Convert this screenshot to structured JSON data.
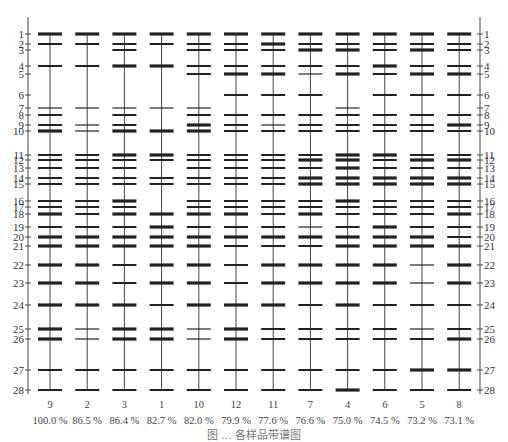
{
  "chart_data": {
    "type": "gel_band_diagram",
    "title": "",
    "axis_label_left": "",
    "band_positions": {
      "1": 34,
      "2": 44,
      "3": 50,
      "4": 66,
      "5": 74,
      "6": 95,
      "7": 108,
      "8": 115,
      "9": 125,
      "10": 131,
      "11": 155,
      "12": 160,
      "13": 168,
      "14": 178,
      "15": 184,
      "16": 201,
      "17": 207,
      "18": 214,
      "19": 227,
      "20": 237,
      "21": 246,
      "22": 265,
      "23": 283,
      "24": 305,
      "25": 329,
      "26": 339,
      "27": 370,
      "28": 390
    },
    "band_numbers": [
      1,
      2,
      3,
      4,
      5,
      6,
      7,
      8,
      9,
      10,
      11,
      12,
      13,
      14,
      15,
      16,
      17,
      18,
      19,
      20,
      21,
      22,
      23,
      24,
      25,
      26,
      27,
      28
    ],
    "band_weight_legend": {
      "1": "thin",
      "2": "medium",
      "3": "thick"
    },
    "lanes": [
      {
        "sample": "9",
        "similarity": "100.0 %",
        "bands": [
          [
            1,
            3
          ],
          [
            2,
            2
          ],
          [
            4,
            2
          ],
          [
            7,
            1
          ],
          [
            8,
            2
          ],
          [
            9,
            2
          ],
          [
            10,
            3
          ],
          [
            11,
            2
          ],
          [
            12,
            2
          ],
          [
            13,
            2
          ],
          [
            14,
            2
          ],
          [
            15,
            2
          ],
          [
            16,
            2
          ],
          [
            17,
            2
          ],
          [
            18,
            3
          ],
          [
            19,
            2
          ],
          [
            20,
            3
          ],
          [
            21,
            3
          ],
          [
            22,
            3
          ],
          [
            23,
            3
          ],
          [
            24,
            3
          ],
          [
            25,
            3
          ],
          [
            26,
            3
          ],
          [
            27,
            2
          ],
          [
            28,
            2
          ]
        ]
      },
      {
        "sample": "2",
        "similarity": "86.5 %",
        "bands": [
          [
            1,
            3
          ],
          [
            2,
            2
          ],
          [
            4,
            2
          ],
          [
            7,
            1
          ],
          [
            9,
            1
          ],
          [
            10,
            1
          ],
          [
            11,
            2
          ],
          [
            12,
            2
          ],
          [
            13,
            2
          ],
          [
            14,
            2
          ],
          [
            15,
            2
          ],
          [
            16,
            2
          ],
          [
            17,
            2
          ],
          [
            18,
            2
          ],
          [
            19,
            2
          ],
          [
            20,
            3
          ],
          [
            21,
            3
          ],
          [
            22,
            3
          ],
          [
            23,
            3
          ],
          [
            24,
            3
          ],
          [
            25,
            1
          ],
          [
            26,
            1
          ],
          [
            27,
            2
          ],
          [
            28,
            2
          ]
        ]
      },
      {
        "sample": "3",
        "similarity": "86.4 %",
        "bands": [
          [
            1,
            3
          ],
          [
            2,
            2
          ],
          [
            3,
            2
          ],
          [
            4,
            3
          ],
          [
            7,
            1
          ],
          [
            8,
            2
          ],
          [
            9,
            2
          ],
          [
            10,
            3
          ],
          [
            11,
            3
          ],
          [
            12,
            2
          ],
          [
            13,
            2
          ],
          [
            14,
            2
          ],
          [
            15,
            2
          ],
          [
            16,
            3
          ],
          [
            17,
            2
          ],
          [
            18,
            3
          ],
          [
            19,
            2
          ],
          [
            20,
            3
          ],
          [
            21,
            3
          ],
          [
            22,
            2
          ],
          [
            23,
            2
          ],
          [
            24,
            3
          ],
          [
            25,
            3
          ],
          [
            26,
            3
          ],
          [
            27,
            2
          ],
          [
            28,
            2
          ]
        ]
      },
      {
        "sample": "1",
        "similarity": "82.7 %",
        "bands": [
          [
            1,
            3
          ],
          [
            2,
            2
          ],
          [
            4,
            3
          ],
          [
            7,
            1
          ],
          [
            10,
            3
          ],
          [
            11,
            3
          ],
          [
            12,
            2
          ],
          [
            14,
            2
          ],
          [
            15,
            2
          ],
          [
            18,
            3
          ],
          [
            19,
            3
          ],
          [
            20,
            3
          ],
          [
            21,
            3
          ],
          [
            22,
            3
          ],
          [
            23,
            3
          ],
          [
            24,
            2
          ],
          [
            25,
            3
          ],
          [
            26,
            3
          ],
          [
            27,
            2
          ],
          [
            28,
            2
          ]
        ]
      },
      {
        "sample": "10",
        "similarity": "82.0 %",
        "bands": [
          [
            1,
            3
          ],
          [
            2,
            2
          ],
          [
            3,
            2
          ],
          [
            4,
            2
          ],
          [
            5,
            2
          ],
          [
            7,
            1
          ],
          [
            8,
            2
          ],
          [
            9,
            3
          ],
          [
            10,
            3
          ],
          [
            11,
            2
          ],
          [
            12,
            2
          ],
          [
            13,
            2
          ],
          [
            14,
            2
          ],
          [
            15,
            2
          ],
          [
            16,
            2
          ],
          [
            17,
            2
          ],
          [
            18,
            3
          ],
          [
            19,
            2
          ],
          [
            20,
            3
          ],
          [
            21,
            3
          ],
          [
            22,
            3
          ],
          [
            23,
            3
          ],
          [
            24,
            3
          ],
          [
            25,
            1
          ],
          [
            26,
            1
          ],
          [
            27,
            2
          ],
          [
            28,
            2
          ]
        ]
      },
      {
        "sample": "12",
        "similarity": "79.9 %",
        "bands": [
          [
            1,
            3
          ],
          [
            2,
            2
          ],
          [
            3,
            2
          ],
          [
            4,
            2
          ],
          [
            5,
            3
          ],
          [
            6,
            2
          ],
          [
            8,
            2
          ],
          [
            9,
            2
          ],
          [
            10,
            2
          ],
          [
            11,
            2
          ],
          [
            12,
            2
          ],
          [
            13,
            2
          ],
          [
            14,
            2
          ],
          [
            15,
            2
          ],
          [
            16,
            2
          ],
          [
            17,
            2
          ],
          [
            18,
            3
          ],
          [
            19,
            2
          ],
          [
            20,
            3
          ],
          [
            21,
            2
          ],
          [
            22,
            2
          ],
          [
            23,
            2
          ],
          [
            24,
            3
          ],
          [
            25,
            3
          ],
          [
            26,
            3
          ],
          [
            27,
            2
          ],
          [
            28,
            2
          ]
        ]
      },
      {
        "sample": "11",
        "similarity": "77.6 %",
        "bands": [
          [
            1,
            3
          ],
          [
            2,
            3
          ],
          [
            3,
            2
          ],
          [
            4,
            2
          ],
          [
            5,
            3
          ],
          [
            6,
            2
          ],
          [
            8,
            2
          ],
          [
            9,
            1
          ],
          [
            10,
            2
          ],
          [
            11,
            2
          ],
          [
            12,
            2
          ],
          [
            13,
            2
          ],
          [
            14,
            2
          ],
          [
            15,
            2
          ],
          [
            16,
            2
          ],
          [
            17,
            2
          ],
          [
            18,
            2
          ],
          [
            19,
            2
          ],
          [
            20,
            3
          ],
          [
            21,
            2
          ],
          [
            22,
            3
          ],
          [
            23,
            3
          ],
          [
            24,
            3
          ],
          [
            25,
            2
          ],
          [
            26,
            2
          ],
          [
            27,
            2
          ],
          [
            28,
            2
          ]
        ]
      },
      {
        "sample": "7",
        "similarity": "76.6 %",
        "bands": [
          [
            1,
            3
          ],
          [
            2,
            2
          ],
          [
            3,
            3
          ],
          [
            4,
            2
          ],
          [
            5,
            1
          ],
          [
            6,
            2
          ],
          [
            8,
            2
          ],
          [
            9,
            2
          ],
          [
            10,
            2
          ],
          [
            11,
            2
          ],
          [
            12,
            3
          ],
          [
            13,
            2
          ],
          [
            14,
            3
          ],
          [
            15,
            3
          ],
          [
            16,
            2
          ],
          [
            17,
            2
          ],
          [
            18,
            3
          ],
          [
            19,
            1
          ],
          [
            20,
            3
          ],
          [
            21,
            2
          ],
          [
            22,
            3
          ],
          [
            23,
            3
          ],
          [
            24,
            2
          ],
          [
            25,
            2
          ],
          [
            26,
            2
          ],
          [
            27,
            2
          ],
          [
            28,
            2
          ]
        ]
      },
      {
        "sample": "4",
        "similarity": "75.0 %",
        "bands": [
          [
            1,
            3
          ],
          [
            2,
            2
          ],
          [
            3,
            3
          ],
          [
            4,
            2
          ],
          [
            5,
            3
          ],
          [
            7,
            1
          ],
          [
            8,
            2
          ],
          [
            9,
            2
          ],
          [
            10,
            2
          ],
          [
            11,
            3
          ],
          [
            12,
            3
          ],
          [
            13,
            3
          ],
          [
            14,
            3
          ],
          [
            15,
            3
          ],
          [
            16,
            3
          ],
          [
            17,
            2
          ],
          [
            18,
            2
          ],
          [
            19,
            2
          ],
          [
            20,
            3
          ],
          [
            21,
            3
          ],
          [
            22,
            3
          ],
          [
            23,
            3
          ],
          [
            24,
            3
          ],
          [
            25,
            2
          ],
          [
            26,
            2
          ],
          [
            27,
            2
          ],
          [
            28,
            3
          ]
        ]
      },
      {
        "sample": "6",
        "similarity": "74.5 %",
        "bands": [
          [
            1,
            3
          ],
          [
            2,
            2
          ],
          [
            3,
            2
          ],
          [
            4,
            3
          ],
          [
            5,
            2
          ],
          [
            6,
            2
          ],
          [
            8,
            2
          ],
          [
            9,
            2
          ],
          [
            10,
            2
          ],
          [
            11,
            3
          ],
          [
            12,
            2
          ],
          [
            13,
            2
          ],
          [
            14,
            3
          ],
          [
            15,
            3
          ],
          [
            16,
            2
          ],
          [
            17,
            2
          ],
          [
            18,
            2
          ],
          [
            19,
            3
          ],
          [
            20,
            3
          ],
          [
            21,
            3
          ],
          [
            22,
            3
          ],
          [
            23,
            3
          ],
          [
            24,
            2
          ],
          [
            25,
            2
          ],
          [
            26,
            2
          ],
          [
            27,
            2
          ],
          [
            28,
            2
          ]
        ]
      },
      {
        "sample": "5",
        "similarity": "73.2 %",
        "bands": [
          [
            1,
            3
          ],
          [
            2,
            2
          ],
          [
            3,
            3
          ],
          [
            4,
            2
          ],
          [
            5,
            3
          ],
          [
            6,
            2
          ],
          [
            8,
            2
          ],
          [
            9,
            2
          ],
          [
            10,
            2
          ],
          [
            11,
            2
          ],
          [
            12,
            3
          ],
          [
            13,
            2
          ],
          [
            14,
            3
          ],
          [
            15,
            3
          ],
          [
            16,
            2
          ],
          [
            17,
            2
          ],
          [
            18,
            2
          ],
          [
            19,
            2
          ],
          [
            20,
            3
          ],
          [
            21,
            3
          ],
          [
            22,
            1
          ],
          [
            23,
            1
          ],
          [
            24,
            2
          ],
          [
            25,
            1
          ],
          [
            26,
            2
          ],
          [
            27,
            3
          ],
          [
            28,
            2
          ]
        ]
      },
      {
        "sample": "8",
        "similarity": "73.1 %",
        "bands": [
          [
            1,
            3
          ],
          [
            2,
            2
          ],
          [
            3,
            2
          ],
          [
            4,
            2
          ],
          [
            5,
            3
          ],
          [
            6,
            2
          ],
          [
            8,
            2
          ],
          [
            9,
            3
          ],
          [
            10,
            2
          ],
          [
            11,
            2
          ],
          [
            12,
            3
          ],
          [
            13,
            2
          ],
          [
            14,
            3
          ],
          [
            15,
            3
          ],
          [
            16,
            2
          ],
          [
            17,
            2
          ],
          [
            18,
            3
          ],
          [
            19,
            2
          ],
          [
            20,
            2
          ],
          [
            21,
            3
          ],
          [
            22,
            3
          ],
          [
            23,
            3
          ],
          [
            24,
            2
          ],
          [
            25,
            2
          ],
          [
            26,
            3
          ],
          [
            27,
            3
          ],
          [
            28,
            2
          ]
        ]
      }
    ],
    "caption": "图 … 各样品带谱图"
  }
}
